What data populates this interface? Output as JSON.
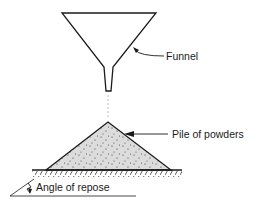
{
  "diagram": {
    "labels": {
      "funnel": "Funnel",
      "pile": "Pile of powders",
      "angle": "Angle of repose"
    },
    "colors": {
      "stroke": "#1a1a1a",
      "pile_fill": "#dcdcdc",
      "background": "#ffffff"
    }
  }
}
